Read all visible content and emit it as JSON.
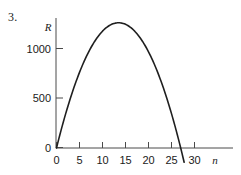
{
  "figure": {
    "problem_number": "3."
  },
  "chart_data": {
    "type": "line",
    "title": "",
    "subtitle": "",
    "xlabel": "n",
    "ylabel": "R",
    "xlim": [
      0,
      32
    ],
    "ylim": [
      -150,
      1350
    ],
    "grid": false,
    "legend": null,
    "x_ticks": [
      {
        "value": 0,
        "label": "0"
      },
      {
        "value": 5,
        "label": "5"
      },
      {
        "value": 10,
        "label": "10"
      },
      {
        "value": 15,
        "label": "15"
      },
      {
        "value": 20,
        "label": "20"
      },
      {
        "value": 25,
        "label": "25"
      },
      {
        "value": 30,
        "label": "30"
      }
    ],
    "y_ticks": [
      {
        "value": 0,
        "label": "0"
      },
      {
        "value": 500,
        "label": "500"
      },
      {
        "value": 1000,
        "label": "1000"
      }
    ],
    "curve": {
      "name": "R(n)",
      "shape": "parabola",
      "vertex": {
        "n": 13.5,
        "R": 1265
      },
      "roots": [
        0,
        27
      ],
      "color": "#1f1f1f",
      "points": [
        {
          "n": 0,
          "R": 0
        },
        {
          "n": 1,
          "R": 185
        },
        {
          "n": 2,
          "R": 357
        },
        {
          "n": 3,
          "R": 516
        },
        {
          "n": 4,
          "R": 662
        },
        {
          "n": 5,
          "R": 796
        },
        {
          "n": 6,
          "R": 916
        },
        {
          "n": 7,
          "R": 1024
        },
        {
          "n": 8,
          "R": 1119
        },
        {
          "n": 9,
          "R": 1200
        },
        {
          "n": 10,
          "R": 1269
        },
        {
          "n": 11,
          "R": 1325
        },
        {
          "n": 12,
          "R": 1368
        },
        {
          "n": 13,
          "R": 1398
        },
        {
          "n": 13.5,
          "R": 1265
        },
        {
          "n": 14,
          "R": 1262
        },
        {
          "n": 15,
          "R": 1250
        },
        {
          "n": 16,
          "R": 1206
        },
        {
          "n": 17,
          "R": 1149
        },
        {
          "n": 18,
          "R": 1080
        },
        {
          "n": 19,
          "R": 997
        },
        {
          "n": 20,
          "R": 901
        },
        {
          "n": 21,
          "R": 793
        },
        {
          "n": 22,
          "R": 671
        },
        {
          "n": 23,
          "R": 536
        },
        {
          "n": 24,
          "R": 389
        },
        {
          "n": 25,
          "R": 228
        },
        {
          "n": 26,
          "R": 55
        },
        {
          "n": 27,
          "R": -132
        }
      ]
    }
  }
}
